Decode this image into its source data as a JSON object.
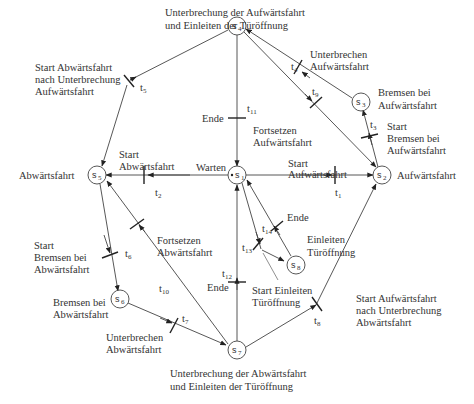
{
  "diagram": {
    "type": "petri-net",
    "places": [
      {
        "id": "s1",
        "name": "s",
        "sub": "1",
        "label": "Warten",
        "token": true
      },
      {
        "id": "s2",
        "name": "s",
        "sub": "2",
        "label": "Aufwärtsfahrt"
      },
      {
        "id": "s3",
        "name": "s",
        "sub": "3",
        "label_lines": [
          "Bremsen bei",
          "Aufwärtsfahrt"
        ]
      },
      {
        "id": "s4",
        "name": "s",
        "sub": "4",
        "label_lines": [
          "Unterbrechung der Aufwärtsfahrt",
          "und Einleiten der Türöffnung"
        ]
      },
      {
        "id": "s5",
        "name": "s",
        "sub": "5",
        "label": "Abwärtsfahrt"
      },
      {
        "id": "s6",
        "name": "s",
        "sub": "6",
        "label_lines": [
          "Bremsen bei",
          "Abwärtsfahrt"
        ]
      },
      {
        "id": "s7",
        "name": "s",
        "sub": "7",
        "label_lines": [
          "Unterbrechung der Abwärtsfahrt",
          "und Einleiten der Türöffnung"
        ]
      },
      {
        "id": "s8",
        "name": "s",
        "sub": "8",
        "label_lines": [
          "Einleiten",
          "Türöffnung"
        ]
      }
    ],
    "transitions": [
      {
        "id": "t1",
        "name": "t",
        "sub": "1",
        "label_lines": [
          "Start",
          "Aufwärtsfahrt"
        ],
        "from": "s1",
        "to": "s2"
      },
      {
        "id": "t2",
        "name": "t",
        "sub": "2",
        "label_lines": [
          "Start",
          "Abwärtsfahrt"
        ],
        "from": "s1",
        "to": "s5"
      },
      {
        "id": "t3",
        "name": "t",
        "sub": "3",
        "label_lines": [
          "Start",
          "Bremsen bei",
          "Aufwärtsfahrt"
        ],
        "from": "s2",
        "to": "s3"
      },
      {
        "id": "t4",
        "name": "t",
        "sub": "4",
        "label_lines": [
          "Unterbrechen",
          "Aufwärtsfahrt"
        ],
        "from": "s3",
        "to": "s4"
      },
      {
        "id": "t5",
        "name": "t",
        "sub": "5",
        "label_lines": [
          "Start Abwärtsfahrt",
          "nach Unterbrechung",
          "Aufwärtsfahrt"
        ],
        "from": "s4",
        "to": "s5"
      },
      {
        "id": "t6",
        "name": "t",
        "sub": "6",
        "label_lines": [
          "Start",
          "Bremsen bei",
          "Abwärtsfahrt"
        ],
        "from": "s5",
        "to": "s6"
      },
      {
        "id": "t7",
        "name": "t",
        "sub": "7",
        "label_lines": [
          "Unterbrechen",
          "Abwärtsfahrt"
        ],
        "from": "s6",
        "to": "s7"
      },
      {
        "id": "t8",
        "name": "t",
        "sub": "8",
        "label_lines": [
          "Start Aufwärtsfahrt",
          "nach Unterbrechung",
          "Abwärtsfahrt"
        ],
        "from": "s7",
        "to": "s2"
      },
      {
        "id": "t9",
        "name": "t",
        "sub": "9",
        "label_lines": [
          "Fortsetzen",
          "Aufwärtsfahrt"
        ],
        "from": "s4",
        "to": "s2"
      },
      {
        "id": "t10",
        "name": "t",
        "sub": "10",
        "label_lines": [
          "Fortsetzen",
          "Abwärtsfahrt"
        ],
        "from": "s7",
        "to": "s5"
      },
      {
        "id": "t11",
        "name": "t",
        "sub": "11",
        "label": "Ende",
        "from": "s4",
        "to": "s1"
      },
      {
        "id": "t12",
        "name": "t",
        "sub": "12",
        "label": "Ende",
        "from": "s7",
        "to": "s1"
      },
      {
        "id": "t13",
        "name": "t",
        "sub": "13",
        "label_lines": [
          "Start Einleiten",
          "Türöffnung"
        ],
        "from": "s1",
        "to": "s8"
      },
      {
        "id": "t14",
        "name": "t",
        "sub": "14",
        "label": "Ende",
        "from": "s8",
        "to": "s1"
      }
    ]
  }
}
